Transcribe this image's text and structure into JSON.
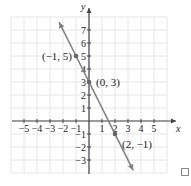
{
  "chart_data": {
    "type": "line",
    "title": "",
    "xlabel": "x",
    "ylabel": "y",
    "xlim": [
      -5.5,
      5.8
    ],
    "ylim": [
      -4,
      8
    ],
    "x_ticks": [
      -5,
      -4,
      -3,
      -2,
      -1,
      1,
      2,
      3,
      4,
      5
    ],
    "y_ticks": [
      -3,
      -2,
      -1,
      1,
      2,
      3,
      4,
      5,
      6,
      7
    ],
    "x_tick_labels": [
      "−5",
      "−4",
      "−3",
      "−2",
      "−1",
      "1",
      "2",
      "3",
      "4",
      "5"
    ],
    "y_tick_labels": [
      "−3",
      "−2",
      "−1",
      "1",
      "2",
      "3",
      "4",
      "5",
      "6",
      "7"
    ],
    "grid": true,
    "series": [
      {
        "name": "line",
        "equation": "y = -2x + 3",
        "x": [
          -2.3,
          3.4
        ],
        "y": [
          7.6,
          -3.8
        ],
        "arrows": "both"
      }
    ],
    "points": [
      {
        "x": -1,
        "y": 5,
        "label": "(−1, 5)"
      },
      {
        "x": 0,
        "y": 3,
        "label": "(0, 3)"
      },
      {
        "x": 2,
        "y": -1,
        "label": "(2, −1)"
      }
    ]
  },
  "labels": {
    "x_axis": "x",
    "y_axis": "y",
    "p1": "(−1, 5)",
    "p2": "(0, 3)",
    "p3": "(2, −1)"
  },
  "colors": {
    "line": "#808080",
    "axis": "#444444",
    "grid": "#e6e6e6"
  }
}
